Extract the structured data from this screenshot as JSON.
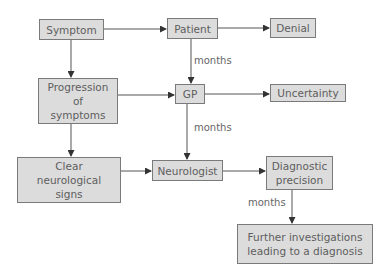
{
  "diagram": {
    "nodes": {
      "symptom": "Symptom",
      "patient": "Patient",
      "denial": "Denial",
      "progression": "Progression\nof\nsymptoms",
      "gp": "GP",
      "uncertainty": "Uncertainty",
      "clear_signs": "Clear\nneurological\nsigns",
      "neurologist": "Neurologist",
      "diagnostic_precision": "Diagnostic\nprecision",
      "further_investigations": "Further investigations\nleading to a diagnosis"
    },
    "edge_labels": {
      "patient_to_gp": "months",
      "gp_to_neurologist": "months",
      "diagnostic_to_further": "months"
    },
    "colors": {
      "box_fill": "#dcdcdc",
      "box_border": "#7a7a7a",
      "line": "#555555",
      "text": "#5e5e5e"
    }
  }
}
